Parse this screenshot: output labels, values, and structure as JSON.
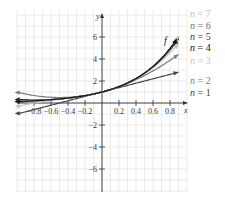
{
  "chart_data": {
    "type": "line",
    "title": "",
    "xlabel": "x",
    "ylabel": "y",
    "xlim": [
      -1.0,
      1.0
    ],
    "ylim": [
      -8,
      8
    ],
    "grid": true,
    "x_ticks": [
      -0.8,
      -0.6,
      -0.4,
      -0.2,
      0.2,
      0.4,
      0.6,
      0.8
    ],
    "x_tick_labels": [
      "−0.8",
      "−0.6",
      "−0.4",
      "−0.2",
      "0.2",
      "0.4",
      "0.6",
      "0.8"
    ],
    "y_ticks": [
      -6,
      -4,
      -2,
      2,
      4,
      6
    ],
    "y_tick_labels": [
      "−6",
      "−4",
      "−2",
      "2",
      "4",
      "6"
    ],
    "legend_position": "right, labels at curve ends",
    "function_label": "f",
    "series": [
      {
        "name": "f",
        "label": "f",
        "color": "#111111",
        "kind": "exp(2x)"
      },
      {
        "name": "n = 7",
        "label": "n = 7",
        "color": "#bdbdbd",
        "n": 7
      },
      {
        "name": "n = 6",
        "label": "n = 6",
        "color": "#6e6e6e",
        "n": 6
      },
      {
        "name": "n = 5",
        "label": "n = 5",
        "color": "#3a3a3a",
        "n": 5
      },
      {
        "name": "n = 4",
        "label": "n = 4",
        "color": "#111111",
        "n": 4
      },
      {
        "name": "n = 3",
        "label": "n = 3",
        "color": "#c4c4c4",
        "n": 3
      },
      {
        "name": "n = 2",
        "label": "n = 2",
        "color": "#7a7a7a",
        "n": 2
      },
      {
        "name": "n = 1",
        "label": "n = 1",
        "color": "#444444",
        "n": 1
      }
    ]
  }
}
